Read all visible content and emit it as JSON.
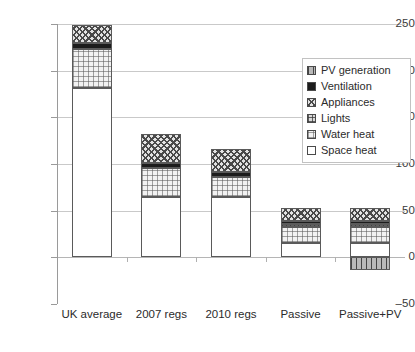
{
  "chart_data": {
    "type": "bar",
    "stacked": true,
    "title": "",
    "subtitle": "",
    "xlabel": "",
    "ylabel": "",
    "categories": [
      "UK average",
      "2007 regs",
      "2010 regs",
      "Passive",
      "Passive+PV"
    ],
    "ylim": [
      -50,
      250
    ],
    "yticks": [
      -50,
      0,
      50,
      100,
      150,
      200,
      250
    ],
    "ytick_labels": [
      "–50",
      "0",
      "50",
      "100",
      "150",
      "200",
      "250"
    ],
    "grid": true,
    "legend_position": "upper right",
    "series": [
      {
        "name": "Space heat",
        "swatch": "white-square",
        "values": [
          181,
          65,
          65,
          15,
          15
        ]
      },
      {
        "name": "Water heat",
        "swatch": "light-grid-square",
        "values": [
          42,
          31,
          21,
          17,
          17
        ]
      },
      {
        "name": "Lights",
        "swatch": "dark-grid-square",
        "values": [
          0,
          0,
          0,
          4,
          4
        ]
      },
      {
        "name": "Ventilation",
        "swatch": "black-square",
        "values": [
          7,
          5,
          5,
          3,
          3
        ]
      },
      {
        "name": "Appliances",
        "swatch": "diagonal-hatch-square",
        "values": [
          19,
          31,
          25,
          14,
          14
        ]
      },
      {
        "name": "PV generation",
        "swatch": "gray-square",
        "values": [
          0,
          0,
          0,
          0,
          -14
        ]
      }
    ],
    "totals": [
      249,
      132,
      116,
      53,
      53
    ]
  },
  "legend": {
    "items": [
      {
        "label": "PV generation"
      },
      {
        "label": "Ventilation"
      },
      {
        "label": "Appliances"
      },
      {
        "label": "Lights"
      },
      {
        "label": "Water heat"
      },
      {
        "label": "Space heat"
      }
    ]
  },
  "axes": {
    "y": {
      "ticks": [
        {
          "label": "250"
        },
        {
          "label": "200"
        },
        {
          "label": "150"
        },
        {
          "label": "100"
        },
        {
          "label": "50"
        },
        {
          "label": "0"
        },
        {
          "label": "–50"
        }
      ]
    },
    "x": {
      "ticks": [
        {
          "label": "UK average"
        },
        {
          "label": "2007 regs"
        },
        {
          "label": "2010 regs"
        },
        {
          "label": "Passive"
        },
        {
          "label": "Passive+PV"
        }
      ]
    }
  }
}
